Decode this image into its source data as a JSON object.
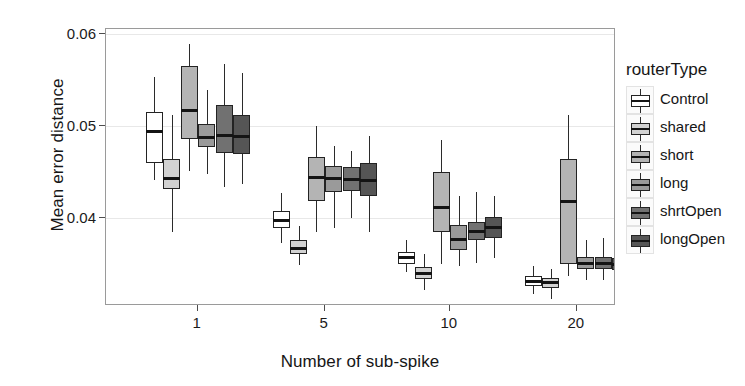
{
  "chart_data": {
    "type": "box",
    "title": "",
    "xlabel": "Number of sub-spike",
    "ylabel": "Mean error distance",
    "ylim": [
      0.0305,
      0.0605
    ],
    "yticks": [
      0.04,
      0.05,
      0.06
    ],
    "ytick_labels": [
      "0.04",
      "0.05",
      "0.06"
    ],
    "xticks": [
      1,
      5,
      10,
      20
    ],
    "xtick_labels": [
      "1",
      "5",
      "10",
      "20"
    ],
    "grid": true,
    "legend_position": "right",
    "legend_title": "routerType",
    "categories": [
      "1",
      "5",
      "10",
      "20"
    ],
    "series": [
      {
        "name": "Control",
        "color": "#ffffff",
        "boxes": [
          {
            "category": "1",
            "whisker_low": 0.0441,
            "q1": 0.046,
            "median": 0.0494,
            "q3": 0.0515,
            "whisker_high": 0.0553
          },
          {
            "category": "5",
            "whisker_low": 0.0373,
            "q1": 0.0389,
            "median": 0.0398,
            "q3": 0.0408,
            "whisker_high": 0.0427
          },
          {
            "category": "10",
            "whisker_low": 0.0342,
            "q1": 0.0351,
            "median": 0.0358,
            "q3": 0.0364,
            "whisker_high": 0.0377
          },
          {
            "category": "20",
            "whisker_low": 0.0318,
            "q1": 0.0327,
            "median": 0.0331,
            "q3": 0.0337,
            "whisker_high": 0.0348
          }
        ]
      },
      {
        "name": "shared",
        "color": "#d2d2d2",
        "boxes": [
          {
            "category": "1",
            "whisker_low": 0.0385,
            "q1": 0.0432,
            "median": 0.0443,
            "q3": 0.0464,
            "whisker_high": 0.0512
          },
          {
            "category": "5",
            "whisker_low": 0.0349,
            "q1": 0.0361,
            "median": 0.0367,
            "q3": 0.0377,
            "whisker_high": 0.0392
          },
          {
            "category": "10",
            "whisker_low": 0.0322,
            "q1": 0.0334,
            "median": 0.034,
            "q3": 0.0347,
            "whisker_high": 0.0361
          },
          {
            "category": "20",
            "whisker_low": 0.0313,
            "q1": 0.0325,
            "median": 0.033,
            "q3": 0.0335,
            "whisker_high": 0.0345
          }
        ]
      },
      {
        "name": "short",
        "color": "#b4b4b4",
        "boxes": [
          {
            "category": "1",
            "whisker_low": 0.0451,
            "q1": 0.0486,
            "median": 0.0517,
            "q3": 0.0565,
            "whisker_high": 0.0589
          },
          {
            "category": "5",
            "whisker_low": 0.0385,
            "q1": 0.0419,
            "median": 0.0444,
            "q3": 0.0466,
            "whisker_high": 0.05
          },
          {
            "category": "10",
            "whisker_low": 0.035,
            "q1": 0.0385,
            "median": 0.0412,
            "q3": 0.045,
            "whisker_high": 0.0485
          },
          {
            "category": "20",
            "whisker_low": 0.0338,
            "q1": 0.035,
            "median": 0.0418,
            "q3": 0.0464,
            "whisker_high": 0.0512
          }
        ]
      },
      {
        "name": "long",
        "color": "#9a9a9a",
        "boxes": [
          {
            "category": "1",
            "whisker_low": 0.0448,
            "q1": 0.0477,
            "median": 0.0487,
            "q3": 0.0502,
            "whisker_high": 0.0539
          },
          {
            "category": "5",
            "whisker_low": 0.0389,
            "q1": 0.0428,
            "median": 0.0443,
            "q3": 0.0457,
            "whisker_high": 0.0478
          },
          {
            "category": "10",
            "whisker_low": 0.0348,
            "q1": 0.0366,
            "median": 0.0377,
            "q3": 0.0393,
            "whisker_high": 0.0424
          },
          {
            "category": "20",
            "whisker_low": 0.0333,
            "q1": 0.0345,
            "median": 0.0351,
            "q3": 0.0358,
            "whisker_high": 0.0377
          }
        ]
      },
      {
        "name": "shrtOpen",
        "color": "#717171",
        "boxes": [
          {
            "category": "1",
            "whisker_low": 0.0434,
            "q1": 0.0471,
            "median": 0.049,
            "q3": 0.0523,
            "whisker_high": 0.0567
          },
          {
            "category": "5",
            "whisker_low": 0.04,
            "q1": 0.0429,
            "median": 0.0442,
            "q3": 0.0456,
            "whisker_high": 0.0473
          },
          {
            "category": "10",
            "whisker_low": 0.0352,
            "q1": 0.0376,
            "median": 0.0386,
            "q3": 0.0396,
            "whisker_high": 0.0428
          },
          {
            "category": "20",
            "whisker_low": 0.0333,
            "q1": 0.0345,
            "median": 0.0351,
            "q3": 0.0358,
            "whisker_high": 0.0379
          }
        ]
      },
      {
        "name": "longOpen",
        "color": "#555555",
        "boxes": [
          {
            "category": "1",
            "whisker_low": 0.0437,
            "q1": 0.047,
            "median": 0.0489,
            "q3": 0.0512,
            "whisker_high": 0.0557
          },
          {
            "category": "5",
            "whisker_low": 0.0385,
            "q1": 0.0424,
            "median": 0.0441,
            "q3": 0.046,
            "whisker_high": 0.0489
          },
          {
            "category": "10",
            "whisker_low": 0.0357,
            "q1": 0.0379,
            "median": 0.039,
            "q3": 0.0401,
            "whisker_high": 0.0424
          },
          {
            "category": "20",
            "whisker_low": 0.0331,
            "q1": 0.0344,
            "median": 0.035,
            "q3": 0.0357,
            "whisker_high": 0.0378
          }
        ]
      }
    ]
  },
  "axes": {
    "y_title": "Mean error distance",
    "x_title": "Number of sub-spike"
  },
  "legend": {
    "title": "routerType",
    "items": [
      {
        "label": "Control",
        "color": "#ffffff"
      },
      {
        "label": "shared",
        "color": "#d2d2d2"
      },
      {
        "label": "short",
        "color": "#b4b4b4"
      },
      {
        "label": "long",
        "color": "#9a9a9a"
      },
      {
        "label": "shrtOpen",
        "color": "#717171"
      },
      {
        "label": "longOpen",
        "color": "#555555"
      }
    ]
  }
}
